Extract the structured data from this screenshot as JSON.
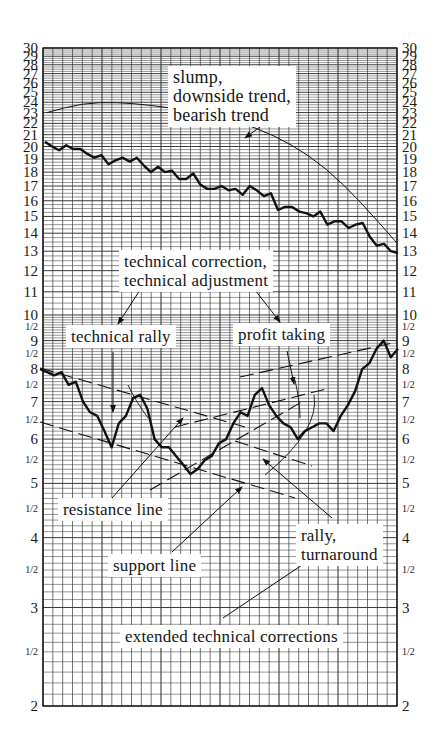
{
  "chart_data": {
    "type": "line",
    "title": "",
    "xlabel": "",
    "ylabel": "",
    "y_scale": "log",
    "ylim": [
      2,
      30
    ],
    "grid": true,
    "y_ticks_left": [
      "30",
      "29",
      "28",
      "27",
      "26",
      "25",
      "24",
      "23",
      "22",
      "21",
      "20",
      "19",
      "18",
      "17",
      "16",
      "15",
      "14",
      "13",
      "12",
      "11",
      "10",
      "1/2",
      "9",
      "1/2",
      "8",
      "1/2",
      "7",
      "1/2",
      "6",
      "1/2",
      "5",
      "1/2",
      "4",
      "1/2",
      "3",
      "1/2",
      "2"
    ],
    "y_ticks_right": [
      "30",
      "29",
      "28",
      "27",
      "26",
      "25",
      "24",
      "23",
      "22",
      "21",
      "20",
      "19",
      "18",
      "17",
      "16",
      "15",
      "14",
      "13",
      "12",
      "11",
      "10",
      "1/2",
      "9",
      "1/2",
      "8",
      "1/2",
      "7",
      "1/2",
      "6",
      "1/2",
      "5",
      "1/2",
      "4",
      "1/2",
      "3",
      "1/2",
      "2"
    ],
    "series": [
      {
        "name": "downtrend price",
        "x": [
          0,
          2,
          4,
          6,
          8,
          10,
          12,
          14,
          16,
          18,
          20,
          22,
          24,
          26,
          28,
          30,
          32,
          34,
          36,
          38,
          40,
          42,
          44,
          46,
          48,
          50,
          52,
          54,
          56,
          58,
          60,
          62,
          64,
          66,
          68,
          70,
          72,
          74,
          76,
          78,
          80,
          82,
          84,
          86,
          88,
          90,
          92,
          94,
          96,
          98,
          100
        ],
        "values": [
          20.4,
          20.0,
          19.7,
          20.1,
          19.8,
          19.8,
          19.4,
          19.1,
          19.3,
          18.6,
          18.9,
          19.1,
          18.8,
          19.1,
          18.5,
          18.0,
          18.4,
          18.0,
          18.1,
          17.5,
          17.5,
          17.9,
          17.1,
          16.8,
          16.8,
          17.0,
          16.7,
          16.8,
          16.4,
          17.0,
          16.7,
          16.3,
          16.5,
          15.4,
          15.6,
          15.6,
          15.3,
          15.2,
          15.0,
          15.3,
          14.5,
          14.7,
          14.7,
          14.3,
          14.5,
          14.6,
          13.8,
          13.3,
          13.4,
          13.0,
          12.9
        ]
      },
      {
        "name": "slump trend curve",
        "x": [
          0,
          10,
          20,
          30,
          40,
          50,
          60,
          70,
          80,
          90,
          100
        ],
        "values": [
          23.0,
          23.9,
          24.0,
          23.7,
          23.2,
          22.6,
          21.6,
          20.2,
          18.3,
          15.9,
          13.5
        ]
      },
      {
        "name": "corrections price",
        "x": [
          0,
          2,
          4,
          6,
          8,
          10,
          12,
          14,
          16,
          18,
          20,
          22,
          24,
          26,
          28,
          30,
          32,
          34,
          36,
          38,
          40,
          42,
          44,
          46,
          48,
          50,
          52,
          54,
          56,
          58,
          60,
          62,
          64,
          66,
          68,
          70,
          72,
          74,
          76,
          78,
          80,
          82,
          84,
          86,
          88,
          90,
          92,
          94,
          96,
          98,
          100
        ],
        "values": [
          8.0,
          7.9,
          7.8,
          7.9,
          7.5,
          7.6,
          7.0,
          6.7,
          6.6,
          6.2,
          5.8,
          6.4,
          6.6,
          7.1,
          7.2,
          6.8,
          6.0,
          5.8,
          5.8,
          5.6,
          5.4,
          5.2,
          5.3,
          5.5,
          5.6,
          5.9,
          6.0,
          6.4,
          6.7,
          6.6,
          7.2,
          7.4,
          6.9,
          6.6,
          6.4,
          6.3,
          6.0,
          6.2,
          6.3,
          6.4,
          6.4,
          6.2,
          6.6,
          6.9,
          7.3,
          8.0,
          8.2,
          8.7,
          9.0,
          8.4,
          8.7
        ]
      }
    ],
    "annotations": [
      "slump, downside trend, bearish trend",
      "technical correction, technical adjustment",
      "technical rally",
      "profit taking",
      "resistance line",
      "support line",
      "rally, turnaround",
      "extended technical corrections"
    ]
  },
  "labels": {
    "slump": [
      "slump,",
      "downside trend,",
      "bearish trend"
    ],
    "correction": [
      "technical correction,",
      "technical adjustment"
    ],
    "rally": "technical rally",
    "profit": "profit taking",
    "resistance": "resistance line",
    "support": "support line",
    "turnaround": [
      "rally,",
      "turnaround"
    ],
    "extended": "extended technical corrections"
  },
  "colors": {
    "grid": "#3a3a3a",
    "line": "#111111",
    "background": "#ffffff"
  }
}
